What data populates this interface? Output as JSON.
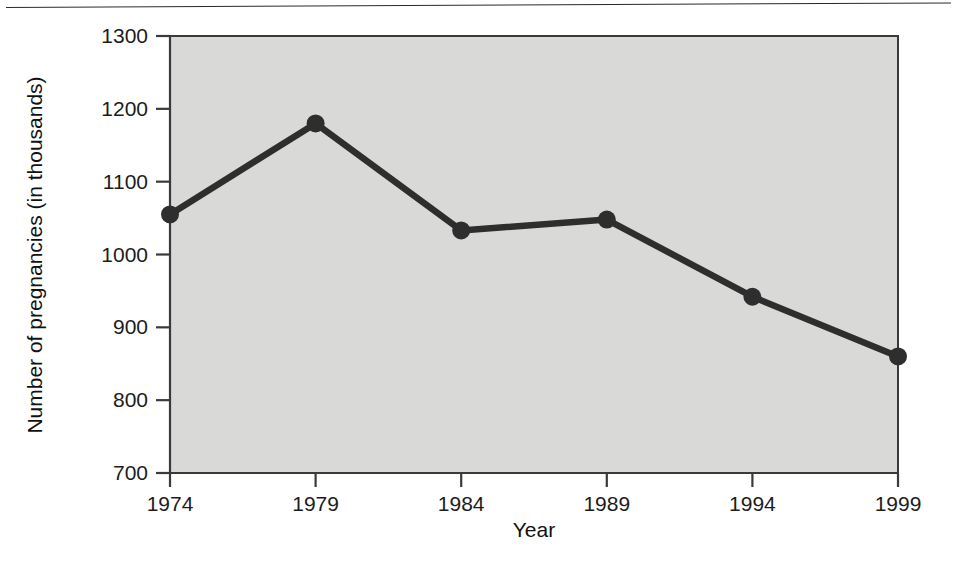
{
  "figure": {
    "background_color": "#ffffff",
    "rule_color": "#2b2b2b",
    "plot_background_color": "#d9d9d7",
    "plot_border_color": "#3a3a3a",
    "series_color": "#2e2e2e"
  },
  "chart_data": {
    "type": "line",
    "title": "",
    "subtitle": "",
    "xlabel": "Year",
    "ylabel": "Number of pregnancies (in thousands)",
    "x": [
      1974,
      1979,
      1984,
      1989,
      1994,
      1999
    ],
    "categories": [
      "1974",
      "1979",
      "1984",
      "1989",
      "1994",
      "1999"
    ],
    "values": [
      1055,
      1180,
      1033,
      1048,
      942,
      860
    ],
    "series": [
      {
        "name": "Number of pregnancies",
        "values": [
          1055,
          1180,
          1033,
          1048,
          942,
          860
        ]
      }
    ],
    "xlim": [
      1974,
      1999
    ],
    "ylim": [
      700,
      1300
    ],
    "xticks": [
      "1974",
      "1979",
      "1984",
      "1989",
      "1994",
      "1999"
    ],
    "yticks": [
      "700",
      "800",
      "900",
      "1000",
      "1100",
      "1200",
      "1300"
    ],
    "ytick_values": [
      700,
      800,
      900,
      1000,
      1100,
      1200,
      1300
    ],
    "grid": false,
    "legend": "none",
    "marker": "circle",
    "annotations": []
  },
  "axes": {
    "y_title": "Number of pregnancies (in thousands)",
    "x_title": "Year",
    "y_tick_labels": [
      "1300",
      "1200",
      "1100",
      "1000",
      "900",
      "800",
      "700"
    ],
    "x_tick_labels": [
      "1974",
      "1979",
      "1984",
      "1989",
      "1994",
      "1999"
    ]
  }
}
